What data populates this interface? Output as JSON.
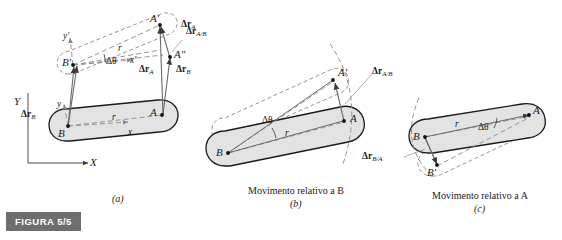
{
  "figure": {
    "badge": "FIGURA 5/5",
    "background_color": "#ffffff",
    "body_fill_color": "#e3e3e3",
    "body_stroke_color": "#1a1a1a",
    "dashed_color": "#8a8a8a",
    "badge_bg_color": "#6e6e6e",
    "badge_text_color": "#ffffff"
  },
  "panels": [
    {
      "id": "(a)",
      "caption": "",
      "labels": {
        "X_axis": "X",
        "Y_axis": "Y",
        "x_prime": "x'",
        "y_prime": "y'",
        "x_small": "x",
        "y_small": "y",
        "r_fixed": "r",
        "r_prime": "r",
        "delta_theta": "Δθ",
        "point_A": "A",
        "point_A_prime": "A'",
        "point_A_dprime": "A\"",
        "point_B": "B",
        "point_B_prime": "B'",
        "dr_A": "Δr",
        "dr_A_sub": "A",
        "dr_B": "Δr",
        "dr_B_sub": "B",
        "dr_B_left": "Δr",
        "dr_B_left_sub": "B",
        "dr_AB": "Δr",
        "dr_AB_sub": "A/B"
      }
    },
    {
      "id": "(b)",
      "caption": "Movimento relativo a B",
      "labels": {
        "point_A": "A",
        "point_A_prime": "A'",
        "point_B": "B",
        "r": "r",
        "delta_theta": "Δθ",
        "dr_AB": "Δr",
        "dr_AB_sub": "A/B"
      }
    },
    {
      "id": "(c)",
      "caption": "Movimento relativo a A",
      "labels": {
        "point_A": "A",
        "point_B": "B",
        "point_B_prime": "B'",
        "r": "r",
        "delta_theta": "Δθ",
        "dr_BA": "Δr",
        "dr_BA_sub": "B/A"
      }
    }
  ]
}
